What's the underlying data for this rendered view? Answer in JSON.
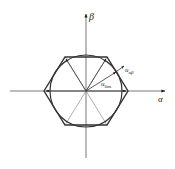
{
  "diagram": {
    "type": "space-vector-hexagon",
    "axes": {
      "alpha_label": "α",
      "beta_label": "β"
    },
    "labels": {
      "u_ab_main": "u",
      "u_ab_sub": "αβ",
      "u_lim_main": "u",
      "u_lim_sub": "lim"
    },
    "colors": {
      "stroke": "#333333",
      "axis": "#555555",
      "background": "#ffffff"
    }
  }
}
